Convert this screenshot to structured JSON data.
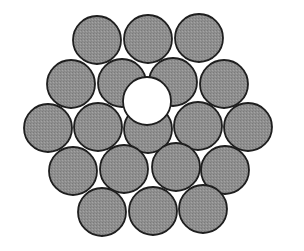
{
  "diagram": {
    "strand_fill": "#8f8f8f",
    "strand_stroke": "#1e1e1e",
    "core_fill": "#ffffff",
    "radius": 24,
    "strands": [
      {
        "cx": 97,
        "cy": 40
      },
      {
        "cx": 148,
        "cy": 39
      },
      {
        "cx": 199,
        "cy": 38
      },
      {
        "cx": 71,
        "cy": 84
      },
      {
        "cx": 122,
        "cy": 83
      },
      {
        "cx": 173,
        "cy": 82
      },
      {
        "cx": 224,
        "cy": 84
      },
      {
        "cx": 48,
        "cy": 128
      },
      {
        "cx": 98,
        "cy": 127
      },
      {
        "cx": 148,
        "cy": 129
      },
      {
        "cx": 198,
        "cy": 126
      },
      {
        "cx": 248,
        "cy": 127
      },
      {
        "cx": 73,
        "cy": 171
      },
      {
        "cx": 124,
        "cy": 169
      },
      {
        "cx": 176,
        "cy": 167
      },
      {
        "cx": 225,
        "cy": 170
      },
      {
        "cx": 102,
        "cy": 212
      },
      {
        "cx": 153,
        "cy": 211
      },
      {
        "cx": 203,
        "cy": 209
      }
    ],
    "core": {
      "cx": 147,
      "cy": 101,
      "r": 24
    }
  }
}
